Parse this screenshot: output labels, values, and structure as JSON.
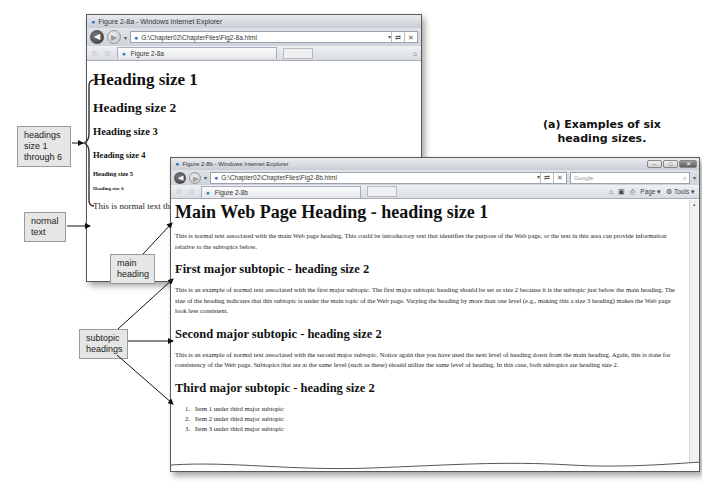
{
  "caption": {
    "line1": "(a) Examples of six",
    "line2": "heading sizes."
  },
  "window_a": {
    "title": "Figure 2-8a - Windows Internet Explorer",
    "address": "G:\\Chapter02\\ChapterFiles\\Fig2-8a.html",
    "refresh_glyph": "↻",
    "tab_label": "Figure 2-8a",
    "headings": [
      "Heading size 1",
      "Heading size 2",
      "Heading size 3",
      "Heading size 4",
      "Heading size 5",
      "Heading size 6"
    ],
    "normal_text": "This is normal text that"
  },
  "window_b": {
    "title": "Figure 2-8b - Windows Internet Explorer",
    "address": "G:\\Chapter02\\ChapterFiles\\Fig2-8b.html",
    "search_placeholder": "Google",
    "tab_label": "Figure 2-8b",
    "toolbar": {
      "page_label": "Page",
      "tools_label": "Tools"
    },
    "main_heading": "Main Web Page Heading - heading size 1",
    "main_paragraph": "This is normal text associated with the main Web page heading. This could be introductory text that identifies the purpose of the Web page, or the text in this area can provide information relative to the subtopics below.",
    "sections": [
      {
        "heading": "First major subtopic - heading size 2",
        "paragraph": "This is an example of normal text associated with the first major subtopic. The first major subtopic heading should be set as size 2 because it is the subtopic just below the main heading. The size of the heading indicates that this subtopic is under the main topic of the Web page. Varying the heading by more than one level (e.g., making this a size 3 heading) makes the Web page look less consistent."
      },
      {
        "heading": "Second major subtopic - heading size 2",
        "paragraph": "This is an example of normal text associated with the second major subtopic. Notice again that you have used the next level of heading down from the main heading. Again, this is done for consistency of the Web page. Subtopics that are at the same level (such as these) should utilize the same level of heading. In this case, both subtopics are heading size 2."
      },
      {
        "heading": "Third major subtopic - heading size 2",
        "list": [
          {
            "num": "1.",
            "text": "Item 1 under third major subtopic"
          },
          {
            "num": "2.",
            "text": "Item 2 under third major subtopic"
          },
          {
            "num": "3.",
            "text": "Item 3 under third major subtopic"
          }
        ]
      }
    ]
  },
  "callouts": {
    "headings": "headings size 1 through 6",
    "headings_lines": [
      "headings",
      "size 1",
      "through 6"
    ],
    "normal_text_lines": [
      "normal",
      "text"
    ],
    "main_heading_lines": [
      "main",
      "heading"
    ],
    "subtopic_lines": [
      "subtopic",
      "headings"
    ]
  },
  "icons": {
    "back": "◀",
    "forward": "▶",
    "dropdown": "▾",
    "ie": "e",
    "favorites": "☆",
    "add_favorites": "☆",
    "search": "⌕",
    "close": "✕",
    "minimize": "–",
    "restore": "□",
    "stop": "✕",
    "refresh": "⇄",
    "home": "⌂",
    "feeds": "▣",
    "print": "⎙",
    "tools": "⚙",
    "scroll_up": "▴"
  },
  "colors": {
    "frame": "#5a5a5a",
    "chrome": "#d3d8de",
    "callout_bg": "#e6e6e6",
    "link_blue": "#3a77c0"
  }
}
